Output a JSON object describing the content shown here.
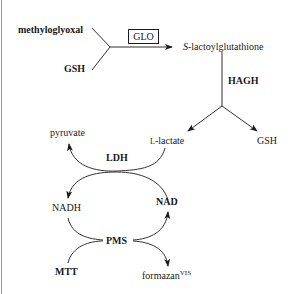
{
  "diagram": {
    "type": "metabolic pathway / assay scheme",
    "nodes": {
      "methylglyoxal": "methyloglyoxal",
      "gsh_in": "GSH",
      "glo": "GLO",
      "s_lactoyl_prefix": "S",
      "s_lactoyl_rest": "-lactoylglutathione",
      "hagh": "HAGH",
      "l_lactate_prefix": "L",
      "l_lactate_rest": "-lactate",
      "gsh_out": "GSH",
      "pyruvate": "pyruvate",
      "ldh": "LDH",
      "nadh": "NADH",
      "nad": "NAD",
      "pms": "PMS",
      "mtt": "MTT",
      "formazan": "formazan",
      "formazan_sup": "VIS"
    },
    "edges": [
      {
        "from": "methyloglyoxal + GSH",
        "to": "S-lactoylglutathione",
        "enzyme": "GLO"
      },
      {
        "from": "S-lactoylglutathione",
        "to": "L-lactate + GSH",
        "enzyme": "HAGH"
      },
      {
        "from": "L-lactate",
        "to": "pyruvate",
        "enzyme": "LDH"
      },
      {
        "from": "NAD",
        "to": "NADH",
        "enzyme": "LDH"
      },
      {
        "from": "NADH",
        "to": "NAD",
        "enzyme": "PMS"
      },
      {
        "from": "MTT",
        "to": "formazan VIS",
        "enzyme": "PMS"
      }
    ],
    "colors": {
      "ink": "#1a1a1a",
      "background": "#ffffff",
      "left_rule": "#9a9a9a"
    }
  }
}
